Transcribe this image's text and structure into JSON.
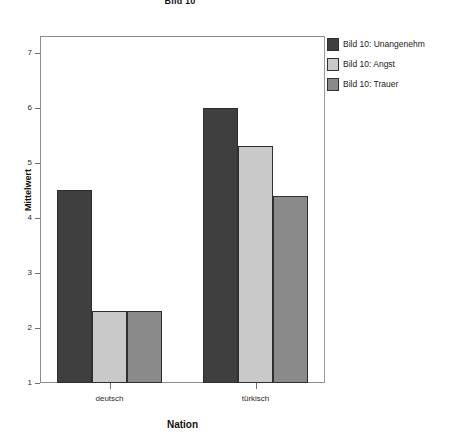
{
  "chart_data": {
    "type": "bar",
    "title": "Bild 10",
    "xlabel": "Nation",
    "ylabel": "Mittelwert",
    "categories": [
      "deutsch",
      "türkisch"
    ],
    "series": [
      {
        "name": "Bild 10: Unangenehm",
        "color": "#3f3f3f",
        "values": [
          4.5,
          6.0
        ]
      },
      {
        "name": "Bild 10: Angst",
        "color": "#c9c9c9",
        "values": [
          2.3,
          5.3
        ]
      },
      {
        "name": "Bild 10: Trauer",
        "color": "#8a8a8a",
        "values": [
          2.3,
          4.4
        ]
      }
    ],
    "ylim": [
      1,
      7.3
    ],
    "yticks": [
      "1",
      "2",
      "3",
      "4",
      "5",
      "6",
      "7"
    ],
    "grid": false,
    "legend_position": "right",
    "frame_color": "#8c8c8c"
  }
}
